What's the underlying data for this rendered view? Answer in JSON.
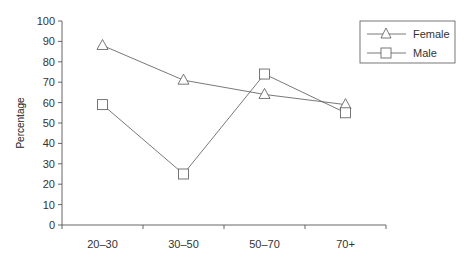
{
  "chart_data": {
    "type": "line",
    "title": "",
    "xlabel": "",
    "ylabel": "Percentage",
    "categories": [
      "20–30",
      "30–50",
      "50–70",
      "70+"
    ],
    "series": [
      {
        "name": "Female",
        "marker": "triangle",
        "values": [
          88,
          71,
          64,
          59
        ]
      },
      {
        "name": "Male",
        "marker": "square",
        "values": [
          59,
          25,
          74,
          55
        ]
      }
    ],
    "ylim": [
      0,
      100
    ],
    "yticks": [
      0,
      10,
      20,
      30,
      40,
      50,
      60,
      70,
      80,
      90,
      100
    ],
    "grid": false,
    "legend_position": "upper right"
  },
  "legend": {
    "female": "Female",
    "male": "Male"
  },
  "axis": {
    "ylabel": "Percentage"
  }
}
